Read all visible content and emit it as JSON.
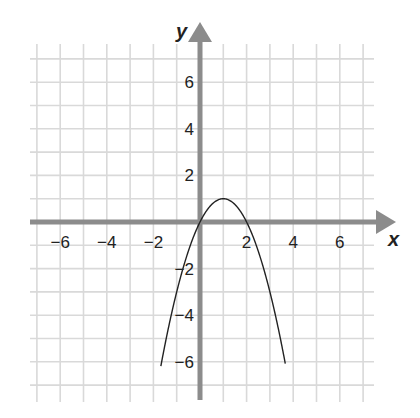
{
  "chart_data": {
    "type": "line",
    "title": "",
    "xlabel": "x",
    "ylabel": "y",
    "xlim": [
      -7,
      7
    ],
    "ylim": [
      -7,
      7
    ],
    "grid": true,
    "xticks": [
      -6,
      -4,
      -2,
      2,
      4,
      6
    ],
    "yticks": [
      6,
      4,
      2,
      -2,
      -4,
      -6
    ],
    "xtick_labels": [
      "−6",
      "−4",
      "−2",
      "2",
      "4",
      "6"
    ],
    "ytick_labels": [
      "6",
      "4",
      "2",
      "−2",
      "−4",
      "−6"
    ],
    "series": [
      {
        "name": "y = -x^2 + 2x",
        "description": "downward parabola, vertex (1, 1), x-intercepts 0 and 2",
        "x": [
          -1.6,
          -1,
          0,
          1,
          2,
          3,
          3.6
        ],
        "y": [
          -5.76,
          -3,
          0,
          1,
          0,
          -3,
          -5.76
        ]
      }
    ],
    "colors": {
      "grid": "#d9d9d9",
      "axis": "#8c8c8c",
      "curve": "#222222"
    }
  },
  "labels": {
    "x_axis": "x",
    "y_axis": "y"
  }
}
